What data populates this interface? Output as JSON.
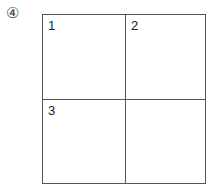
{
  "option_label": "④",
  "grid": {
    "cells": [
      {
        "number": "1"
      },
      {
        "number": "2"
      },
      {
        "number": "3"
      },
      {
        "number": ""
      }
    ]
  }
}
